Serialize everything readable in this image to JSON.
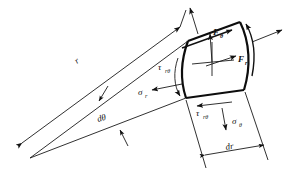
{
  "figure": {
    "background_color": "#ffffff",
    "line_color": "#111111",
    "element_outline_color": "#0d0d0d"
  },
  "labels": {
    "radius": {
      "base": "r",
      "sub": "",
      "name": "radius-label"
    },
    "d_theta": {
      "base": "d",
      "sub": "",
      "greek": "θ",
      "text": "dθ",
      "name": "d-theta-label"
    },
    "d_r": {
      "text": "dr",
      "name": "dr-label"
    },
    "sigma_r": {
      "base": "σ",
      "sub": "r",
      "name": "sigma-r-label"
    },
    "sigma_theta": {
      "base": "σ",
      "sub": "θ",
      "name": "sigma-theta-label"
    },
    "tau_r_theta_inner": {
      "base": "τ",
      "sub": "rθ",
      "name": "tau-r-theta-inner-label"
    },
    "tau_r_theta_bottom": {
      "base": "τ",
      "sub": "rθ",
      "name": "tau-r-theta-bottom-label"
    },
    "F_theta": {
      "base": "F",
      "sub": "θ",
      "name": "f-theta-label"
    },
    "F_r": {
      "base": "F",
      "sub": "r",
      "name": "f-r-label"
    }
  },
  "annotations": {
    "element_shape": "curvilinear quadrilateral wedge segment",
    "arrows": [
      {
        "name": "sigma-r-arrow",
        "direction": "left",
        "description": "radial normal stress on inner face"
      },
      {
        "name": "sigma-theta-arrow",
        "direction": "down",
        "description": "hoop normal stress on bottom face"
      },
      {
        "name": "tau-inner-arrow",
        "direction": "down-along-inner-arc",
        "description": "shear on inner arc"
      },
      {
        "name": "tau-bottom-arrow",
        "direction": "left-along-bottom-edge",
        "description": "shear on bottom edge"
      },
      {
        "name": "f-theta-arrow",
        "direction": "up",
        "description": "body force tangential component"
      },
      {
        "name": "f-r-arrow",
        "direction": "up-right",
        "description": "body force radial component"
      },
      {
        "name": "outer-arc-shear-arrow",
        "direction": "up-along-outer-arc",
        "description": "shear on outer arc"
      },
      {
        "name": "outer-radial-arrow",
        "direction": "out-right",
        "description": "radial stress on outer face"
      },
      {
        "name": "top-edge-shear-arrow",
        "direction": "up-right-along-top-edge",
        "description": "shear on top edge"
      },
      {
        "name": "top-normal-arrow",
        "direction": "up",
        "description": "hoop stress on top face"
      }
    ],
    "dimensions": [
      {
        "name": "radius-dimension",
        "label": "r",
        "description": "from apex to outer arc"
      },
      {
        "name": "d-theta-dimension",
        "label": "dθ",
        "description": "wedge included angle"
      },
      {
        "name": "dr-dimension",
        "label": "dr",
        "description": "radial thickness of element"
      }
    ]
  }
}
